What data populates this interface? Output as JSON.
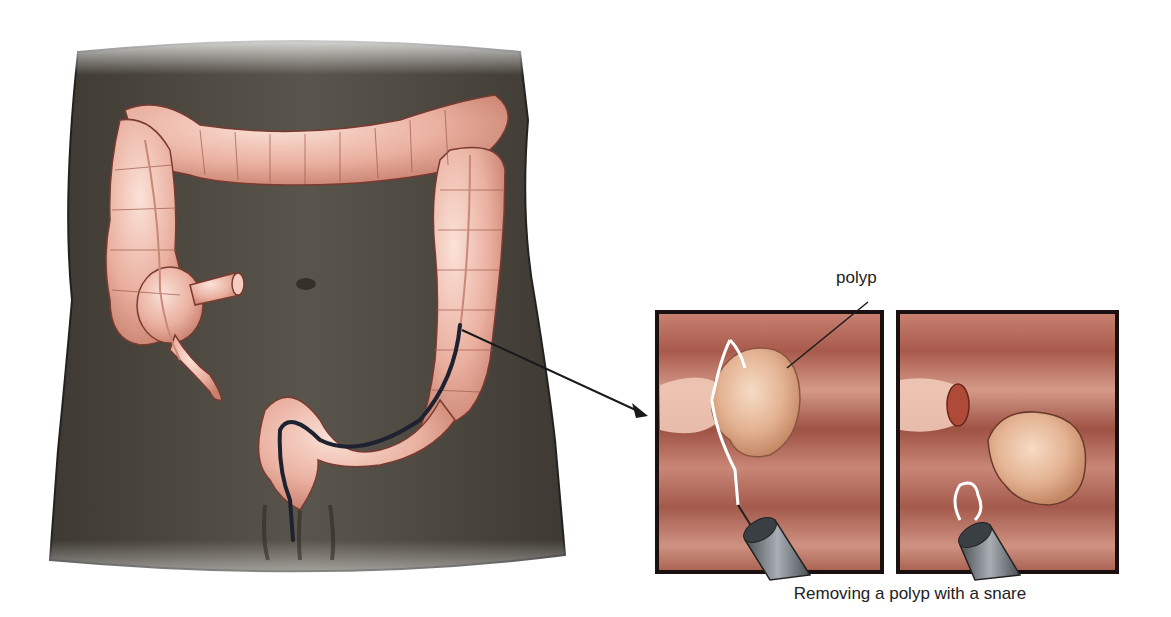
{
  "figure": {
    "labels": {
      "polyp": "polyp"
    },
    "caption": "Removing a polyp with a snare",
    "panels": [
      {
        "id": "panel-snare-around-polyp",
        "description": "Wire snare looped around stalk of polyp, endoscope at bottom"
      },
      {
        "id": "panel-polyp-removed",
        "description": "Polyp severed from stalk, snare retracted into endoscope"
      }
    ],
    "colors": {
      "torso": "#4e4a42",
      "colon": "#eab0a0",
      "colon_outline": "#7a3a30",
      "mucosa": "#b5695a",
      "polyp": "#e4b393",
      "scope": "#6d7378",
      "panel_border": "#1a1010"
    }
  }
}
